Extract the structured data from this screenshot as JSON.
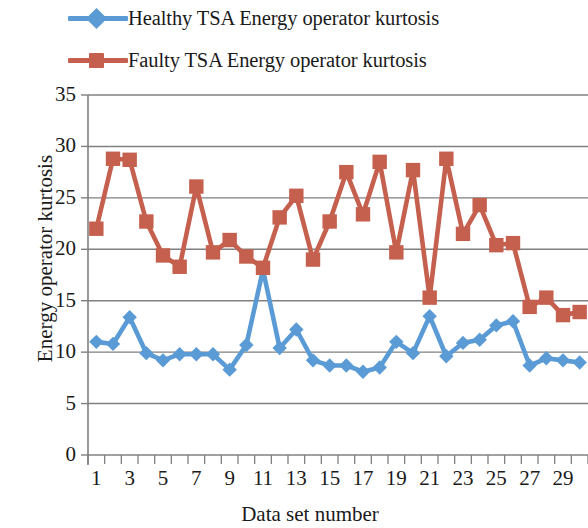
{
  "legend": {
    "position": "top",
    "items": [
      {
        "label": "Healthy TSA Energy operator kurtosis",
        "color": "#5B9BD5",
        "marker": "diamond",
        "marker_name": "legend-marker-healthy"
      },
      {
        "label": "Faulty TSA Energy operator kurtosis",
        "color": "#C5604E",
        "marker": "square",
        "marker_name": "legend-marker-faulty"
      }
    ]
  },
  "axes": {
    "y_title": "Energy operator kurtosis",
    "x_title": "Data set number",
    "y_ticks": [
      "0",
      "5",
      "10",
      "15",
      "20",
      "25",
      "30",
      "35"
    ],
    "x_ticks": [
      "1",
      "3",
      "5",
      "7",
      "9",
      "11",
      "13",
      "15",
      "17",
      "19",
      "21",
      "23",
      "25",
      "27",
      "29"
    ]
  },
  "chart_data": {
    "type": "line",
    "title": "",
    "xlabel": "Data set number",
    "ylabel": "Energy operator kurtosis",
    "xlim": [
      0.5,
      30.5
    ],
    "ylim": [
      0,
      35
    ],
    "ytick_step": 5,
    "grid": true,
    "grid_axis": "y",
    "legend_position": "top",
    "x": [
      1,
      2,
      3,
      4,
      5,
      6,
      7,
      8,
      9,
      10,
      11,
      12,
      13,
      14,
      15,
      16,
      17,
      18,
      19,
      20,
      21,
      22,
      23,
      24,
      25,
      26,
      27,
      28,
      29,
      30
    ],
    "series": [
      {
        "name": "Healthy TSA Energy operator kurtosis",
        "color": "#5B9BD5",
        "marker": "diamond",
        "values": [
          11.0,
          10.8,
          13.4,
          9.9,
          9.2,
          9.8,
          9.8,
          9.8,
          8.3,
          10.7,
          18.0,
          10.4,
          12.2,
          9.2,
          8.7,
          8.7,
          8.1,
          8.5,
          11.0,
          9.9,
          13.5,
          9.6,
          10.9,
          11.2,
          12.6,
          13.0,
          8.7,
          9.4,
          9.2,
          9.0
        ]
      },
      {
        "name": "Faulty TSA Energy operator kurtosis",
        "color": "#C5604E",
        "marker": "square",
        "values": [
          22.0,
          28.8,
          28.7,
          22.7,
          19.4,
          18.3,
          26.1,
          19.7,
          20.9,
          19.3,
          18.2,
          23.1,
          25.2,
          19.0,
          22.7,
          27.5,
          23.4,
          28.5,
          19.7,
          27.7,
          15.3,
          28.8,
          21.5,
          24.3,
          20.4,
          20.6,
          14.4,
          15.3,
          13.6,
          13.9
        ]
      }
    ]
  }
}
